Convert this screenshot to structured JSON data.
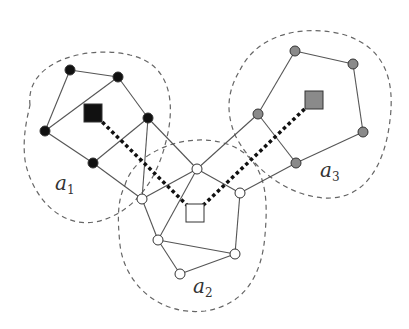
{
  "diagram": {
    "type": "graph-clusters",
    "colors": {
      "black_node": "#111111",
      "grey_node": "#8a8a8a",
      "white_node": "#ffffff",
      "edge": "#555555",
      "outline": "#666666",
      "link": "#111111"
    },
    "clusters": [
      {
        "id": "a1",
        "label": "a",
        "subscript": "1",
        "label_pos": [
          55,
          190
        ],
        "fill": "#111111",
        "outline_path": "M 30 105 C 25 60, 90 45, 130 55 C 175 65, 175 110, 165 145 C 155 185, 130 215, 95 222 C 55 228, 30 190, 25 160 C 22 135, 28 115, 30 105 Z",
        "hub": {
          "x": 93,
          "y": 113
        },
        "nodes": [
          [
            70,
            70
          ],
          [
            118,
            77
          ],
          [
            148,
            118
          ],
          [
            45,
            131
          ],
          [
            93,
            163
          ]
        ],
        "edges": [
          [
            0,
            1
          ],
          [
            1,
            2
          ],
          [
            0,
            3
          ],
          [
            3,
            1
          ],
          [
            3,
            4
          ],
          [
            4,
            2
          ]
        ]
      },
      {
        "id": "a2",
        "label": "a",
        "subscript": "2",
        "label_pos": [
          193,
          293
        ],
        "fill": "#ffffff",
        "outline_path": "M 125 185 C 135 150, 190 130, 230 145 C 268 160, 268 200, 265 235 C 262 275, 245 305, 205 311 C 160 316, 125 285, 120 245 C 117 215, 118 200, 125 185 Z",
        "hub": {
          "x": 195,
          "y": 213
        },
        "nodes": [
          [
            197,
            169
          ],
          [
            142,
            199
          ],
          [
            240,
            193
          ],
          [
            158,
            240
          ],
          [
            235,
            254
          ],
          [
            180,
            274
          ]
        ],
        "edges": [
          [
            0,
            1
          ],
          [
            0,
            2
          ],
          [
            0,
            3
          ],
          [
            1,
            3
          ],
          [
            2,
            4
          ],
          [
            3,
            4
          ],
          [
            3,
            5
          ],
          [
            5,
            4
          ]
        ]
      },
      {
        "id": "a3",
        "label": "a",
        "subscript": "3",
        "label_pos": [
          320,
          177
        ],
        "fill": "#8a8a8a",
        "outline_path": "M 240 70 C 260 30, 310 25, 345 35 C 385 48, 395 80, 390 120 C 385 165, 365 200, 325 198 C 285 196, 250 165, 235 135 C 225 110, 228 90, 240 70 Z",
        "hub": {
          "x": 314,
          "y": 100
        },
        "nodes": [
          [
            295,
            51
          ],
          [
            353,
            64
          ],
          [
            258,
            114
          ],
          [
            363,
            132
          ],
          [
            296,
            163
          ]
        ],
        "edges": [
          [
            0,
            1
          ],
          [
            1,
            3
          ],
          [
            3,
            4
          ],
          [
            4,
            2
          ],
          [
            2,
            0
          ]
        ]
      }
    ],
    "inter_cluster_edges": [
      [
        [
          148,
          118
        ],
        [
          197,
          169
        ]
      ],
      [
        [
          148,
          118
        ],
        [
          142,
          199
        ]
      ],
      [
        [
          93,
          163
        ],
        [
          142,
          199
        ]
      ],
      [
        [
          258,
          114
        ],
        [
          197,
          169
        ]
      ],
      [
        [
          296,
          163
        ],
        [
          240,
          193
        ]
      ]
    ],
    "hub_links": [
      {
        "from": "a1",
        "to": "a2",
        "style": "dotted-thick"
      },
      {
        "from": "a3",
        "to": "a2",
        "style": "dotted-thick"
      }
    ]
  }
}
